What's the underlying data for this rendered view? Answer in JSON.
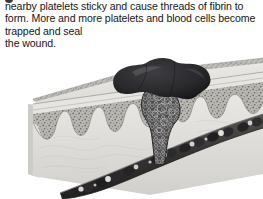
{
  "page": {
    "background_color": "#ffffff",
    "width": 263,
    "height": 199
  },
  "caption": {
    "text": "nearby platelets sticky and cause threads of fibrin to form. More and more platelets and blood cells become trapped and seal\nthe wound.",
    "text_color": "#161616"
  },
  "figure": {
    "style": "grayscale-airbrush-illustration",
    "parts": [
      {
        "name": "epidermis-surface",
        "label": "epidermis",
        "color": "#e8e6e2"
      },
      {
        "name": "epidermis-granular-band",
        "label": "granular layer",
        "color": "#b5b3ae"
      },
      {
        "name": "dermal-papillae",
        "label": "dermal papillae",
        "color": "#a9a7a2"
      },
      {
        "name": "dermis-body",
        "label": "dermis",
        "color": "#dcdad6"
      },
      {
        "name": "clot-scab",
        "label": "clot (scab)",
        "color": "#2a2a2c"
      },
      {
        "name": "fibrin-mesh",
        "label": "fibrin mesh",
        "color": "#4a4a4c"
      },
      {
        "name": "blood-vessel",
        "label": "blood vessel",
        "color": "#3a3a3c"
      },
      {
        "name": "red-blood-cells",
        "label": "red blood cells",
        "color": "#2e2e30"
      },
      {
        "name": "platelets",
        "label": "platelets",
        "color": "#d8d6d2"
      }
    ]
  }
}
